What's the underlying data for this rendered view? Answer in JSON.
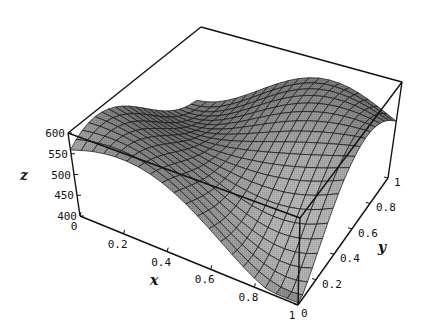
{
  "chart_data": {
    "type": "surface3d",
    "title": "",
    "xlabel": "x",
    "ylabel": "y",
    "zlabel": "z",
    "x_range": [
      0,
      1
    ],
    "y_range": [
      0,
      1
    ],
    "z_range": [
      400,
      600
    ],
    "x_ticks": [
      "0",
      "0.2",
      "0.4",
      "0.6",
      "0.8",
      "1"
    ],
    "y_ticks": [
      "0",
      "0.2",
      "0.4",
      "0.6",
      "0.8",
      "1"
    ],
    "z_ticks": [
      "400",
      "450",
      "500",
      "550",
      "600"
    ],
    "grid_lines": 20,
    "box": true,
    "sample_points": [
      {
        "x": 0,
        "y": 0,
        "z": 500
      },
      {
        "x": 0,
        "y": 0.2,
        "z": 590
      },
      {
        "x": 0.4,
        "y": 0.1,
        "z": 420
      },
      {
        "x": 1,
        "y": 0,
        "z": 480
      },
      {
        "x": 1,
        "y": 0.3,
        "z": 410
      },
      {
        "x": 0.5,
        "y": 1,
        "z": 600
      },
      {
        "x": 1,
        "y": 1,
        "z": 560
      },
      {
        "x": 0,
        "y": 1,
        "z": 540
      }
    ],
    "colors": {
      "surface_light": "#d8d8d8",
      "surface_dark": "#6a6a6a",
      "mesh": "#111111",
      "box": "#111111"
    }
  }
}
